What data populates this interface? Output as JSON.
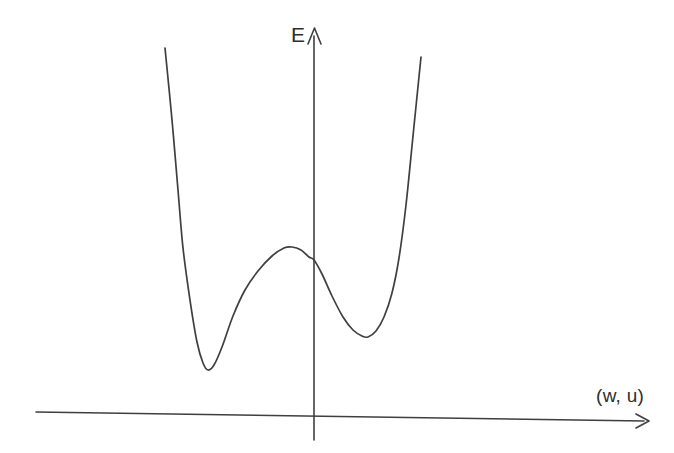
{
  "figure": {
    "kind": "hand-drawn-sketch",
    "title": "",
    "background_color": "#ffffff",
    "ink_color": "#3f3f3f"
  },
  "axes": {
    "vertical": {
      "label": "E",
      "label_name": "energy-axis-label",
      "arrow": "up"
    },
    "horizontal": {
      "label": "(w, u)",
      "label_name": "order-parameter-axis-label",
      "arrow": "right"
    }
  },
  "chart_data": {
    "type": "line",
    "title": "",
    "xlabel": "(w, u)",
    "ylabel": "E",
    "grid": false,
    "legend": null,
    "annotations": [],
    "axis_geometry": {
      "y_axis_x": 314,
      "y_axis_top": 28,
      "y_axis_bottom": 440,
      "x_axis_left": [
        36,
        412
      ],
      "x_axis_right": [
        648,
        421
      ]
    },
    "features": {
      "left_branch_top": [
        165,
        48
      ],
      "left_minimum": [
        208,
        370
      ],
      "central_maximum": [
        292,
        247
      ],
      "axis_crossing": [
        314,
        260
      ],
      "right_minimum": [
        368,
        337
      ],
      "right_branch_top": [
        421,
        57
      ]
    },
    "series": [
      {
        "name": "E",
        "points": [
          [
            165,
            48
          ],
          [
            172,
            120
          ],
          [
            178,
            190
          ],
          [
            183,
            248
          ],
          [
            190,
            300
          ],
          [
            197,
            342
          ],
          [
            203,
            363
          ],
          [
            208,
            370
          ],
          [
            214,
            365
          ],
          [
            222,
            347
          ],
          [
            233,
            316
          ],
          [
            245,
            290
          ],
          [
            258,
            271
          ],
          [
            272,
            256
          ],
          [
            284,
            248
          ],
          [
            292,
            247
          ],
          [
            301,
            250
          ],
          [
            309,
            257
          ],
          [
            314,
            260
          ],
          [
            322,
            274
          ],
          [
            332,
            296
          ],
          [
            343,
            317
          ],
          [
            353,
            330
          ],
          [
            362,
            336
          ],
          [
            368,
            337
          ],
          [
            376,
            331
          ],
          [
            384,
            317
          ],
          [
            392,
            293
          ],
          [
            399,
            258
          ],
          [
            406,
            205
          ],
          [
            413,
            136
          ],
          [
            421,
            57
          ]
        ]
      }
    ]
  }
}
